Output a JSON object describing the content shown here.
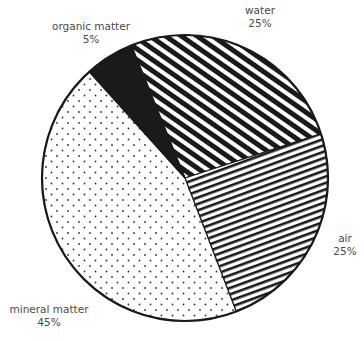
{
  "chart_data": {
    "type": "pie",
    "title": "",
    "center": [
      185,
      178
    ],
    "radius": 143,
    "slices": [
      {
        "name": "water",
        "value": 25,
        "display": "25%",
        "start_deg": 248,
        "end_deg": 342,
        "pattern": "diagonal-stripes-steep"
      },
      {
        "name": "air",
        "value": 25,
        "display": "25%",
        "start_deg": 342,
        "end_deg": 429,
        "pattern": "diagonal-stripes-shallow"
      },
      {
        "name": "mineral matter",
        "value": 45,
        "display": "45%",
        "start_deg": 69,
        "end_deg": 228,
        "pattern": "dots"
      },
      {
        "name": "organic matter",
        "value": 5,
        "display": "5%",
        "start_deg": 228,
        "end_deg": 248,
        "pattern": "solid-black"
      }
    ],
    "legend": "none (direct labels outside slices)"
  },
  "labels": {
    "water": {
      "name": "water",
      "pct": "25%"
    },
    "air": {
      "name": "air",
      "pct": "25%"
    },
    "mineral": {
      "name": "mineral matter",
      "pct": "45%"
    },
    "organic": {
      "name": "organic matter",
      "pct": "5%"
    }
  },
  "colors": {
    "ink": "#1a1a1a",
    "label": "#4a4a4a",
    "background": "#ffffff"
  }
}
